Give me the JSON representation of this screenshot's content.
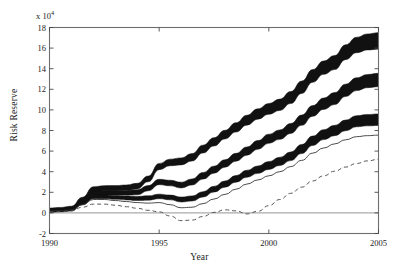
{
  "chart_data": {
    "type": "line",
    "title": "",
    "xlabel": "Year",
    "ylabel": "Risk Reserve",
    "y_multiplier_text": "x 10",
    "y_multiplier_exponent": "4",
    "y_multiplier": 10000,
    "xlim": [
      1990,
      2005
    ],
    "ylim": [
      -2,
      18
    ],
    "xticks": [
      1990,
      1995,
      2000,
      2005
    ],
    "yticks": [
      -2,
      0,
      2,
      4,
      6,
      8,
      10,
      12,
      14,
      16,
      18
    ],
    "xtick_labels": [
      "1990",
      "1995",
      "2000",
      "2005"
    ],
    "ytick_labels": [
      "-2",
      "0",
      "2",
      "4",
      "6",
      "8",
      "10",
      "12",
      "14",
      "16",
      "18"
    ],
    "grid": false,
    "legend_position": "none",
    "zero_line": true,
    "x": [
      1990,
      1990.5,
      1991,
      1991.5,
      1992,
      1992.5,
      1993,
      1993.5,
      1994,
      1994.5,
      1995,
      1995.5,
      1996,
      1996.5,
      1997,
      1997.5,
      1998,
      1998.5,
      1999,
      1999.5,
      2000,
      2000.5,
      2001,
      2001.5,
      2002,
      2002.5,
      2003,
      2003.5,
      2004,
      2004.5,
      2005
    ],
    "series": [
      {
        "name": "upper-band",
        "style": "thick-solid-band",
        "color": "#111111",
        "band_halfwidth": [
          0.18,
          0.18,
          0.2,
          0.22,
          0.24,
          0.24,
          0.25,
          0.26,
          0.27,
          0.28,
          0.3,
          0.32,
          0.34,
          0.36,
          0.38,
          0.4,
          0.42,
          0.45,
          0.48,
          0.5,
          0.52,
          0.55,
          0.58,
          0.6,
          0.62,
          0.65,
          0.68,
          0.72,
          0.75,
          0.78,
          0.8
        ],
        "values": [
          0.3,
          0.35,
          0.45,
          1.3,
          2.3,
          2.4,
          2.4,
          2.45,
          2.6,
          3.3,
          4.5,
          4.9,
          5.0,
          5.4,
          6.2,
          6.9,
          7.6,
          8.3,
          9.0,
          9.6,
          10.1,
          10.5,
          11.2,
          12.2,
          13.3,
          14.1,
          14.6,
          15.6,
          16.3,
          16.6,
          16.7
        ]
      },
      {
        "name": "middle-band",
        "style": "thick-solid-band",
        "color": "#111111",
        "band_halfwidth": [
          0.16,
          0.16,
          0.18,
          0.2,
          0.22,
          0.22,
          0.22,
          0.23,
          0.24,
          0.25,
          0.26,
          0.27,
          0.28,
          0.3,
          0.32,
          0.34,
          0.36,
          0.38,
          0.4,
          0.42,
          0.44,
          0.46,
          0.48,
          0.5,
          0.52,
          0.55,
          0.58,
          0.6,
          0.62,
          0.64,
          0.65
        ],
        "values": [
          0.25,
          0.3,
          0.4,
          1.1,
          1.9,
          1.95,
          1.95,
          1.95,
          2.0,
          2.4,
          3.0,
          2.9,
          2.7,
          3.0,
          3.6,
          4.2,
          4.8,
          5.4,
          6.0,
          6.6,
          7.2,
          7.6,
          8.2,
          9.0,
          9.9,
          10.6,
          11.1,
          11.9,
          12.5,
          12.8,
          12.9
        ]
      },
      {
        "name": "lower-band",
        "style": "thick-solid-band",
        "color": "#111111",
        "band_halfwidth": [
          0.14,
          0.14,
          0.16,
          0.17,
          0.18,
          0.18,
          0.18,
          0.19,
          0.2,
          0.21,
          0.22,
          0.23,
          0.24,
          0.25,
          0.26,
          0.28,
          0.3,
          0.32,
          0.34,
          0.36,
          0.38,
          0.4,
          0.42,
          0.44,
          0.46,
          0.48,
          0.5,
          0.52,
          0.54,
          0.55,
          0.56
        ],
        "values": [
          0.2,
          0.25,
          0.35,
          0.95,
          1.55,
          1.55,
          1.5,
          1.45,
          1.4,
          1.45,
          1.6,
          1.5,
          1.3,
          1.4,
          1.8,
          2.3,
          2.8,
          3.3,
          3.8,
          4.2,
          4.6,
          5.0,
          5.5,
          6.2,
          7.0,
          7.6,
          8.0,
          8.5,
          8.9,
          9.0,
          9.05
        ]
      },
      {
        "name": "thin-solid",
        "style": "thin-solid",
        "color": "#2b2b2b",
        "values": [
          0.2,
          0.22,
          0.3,
          0.8,
          1.3,
          1.3,
          1.2,
          1.1,
          1.0,
          0.95,
          1.0,
          0.8,
          0.5,
          0.55,
          0.9,
          1.35,
          1.8,
          2.3,
          2.8,
          3.2,
          3.6,
          4.0,
          4.5,
          5.1,
          5.8,
          6.3,
          6.7,
          7.1,
          7.4,
          7.5,
          7.55
        ]
      },
      {
        "name": "dashed",
        "style": "dashed",
        "color": "#555555",
        "values": [
          0.1,
          0.12,
          0.2,
          0.55,
          0.85,
          0.85,
          0.75,
          0.6,
          0.45,
          0.25,
          0.1,
          -0.3,
          -0.75,
          -0.7,
          -0.35,
          0.05,
          0.3,
          0.2,
          -0.1,
          0.15,
          0.7,
          1.3,
          1.9,
          2.5,
          3.1,
          3.6,
          4.05,
          4.45,
          4.8,
          5.05,
          5.2
        ]
      }
    ]
  },
  "axes": {
    "y_multiplier_label": "x 10⁴",
    "ylabel": "Risk Reserve",
    "xlabel": "Year"
  }
}
